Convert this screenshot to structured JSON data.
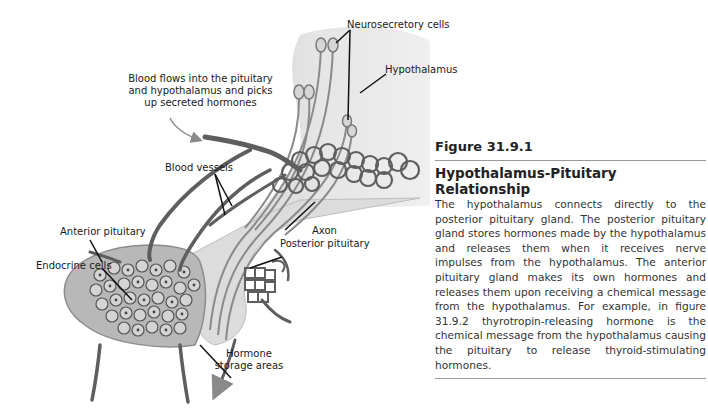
{
  "diagram": {
    "labels": {
      "neurosecretory_cells": "Neurosecretory cells",
      "hypothalamus": "Hypothalamus",
      "blood_flow_line1": "Blood flows into the pituitary",
      "blood_flow_line2": "and hypothalamus and picks",
      "blood_flow_line3": "up secreted hormones",
      "blood_vessels": "Blood vessels",
      "axon": "Axon",
      "posterior_pituitary": "Posterior pituitary",
      "anterior_pituitary": "Anterior pituitary",
      "endocrine_cells": "Endocrine cells",
      "hormone_storage_line1": "Hormone",
      "hormone_storage_line2": "storage areas"
    },
    "colors": {
      "vessel": "#5e5e5e",
      "hypothalamus_fill": "#e8e8e8",
      "pituitary_fill": "#bdbdbd",
      "cell_fill": "#8a8a8a"
    }
  },
  "caption": {
    "figure_number": "Figure 31.9.1",
    "title": "Hypothalamus-Pituitary Relationship",
    "body": "The hypothalamus connects directly to the posterior pituitary gland. The posterior pituitary gland stores hormones made by the hypothalamus and releases them when it receives nerve impulses from the hypothalamus. The anterior pituitary gland makes its own hormones and releases them upon receiving a chemical message from the hypothalamus. For example, in figure 31.9.2 thyrotropin-releasing hormone is the chemical message from the hypothalamus causing the pituitary to release thyroid-stimulating hormones."
  }
}
